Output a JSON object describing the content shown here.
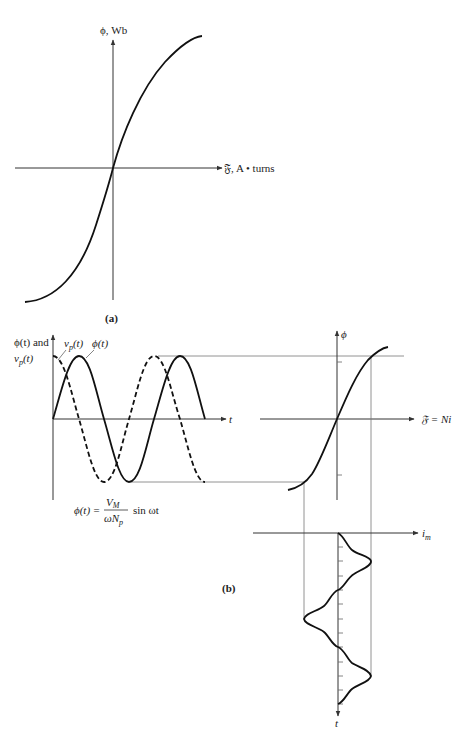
{
  "figure_a": {
    "y_axis_label": "ϕ, Wb",
    "x_axis_label": "𝔉, A • turns",
    "caption": "(a)",
    "curve": "magnetization curve (saturating S-curve through origin)"
  },
  "figure_b": {
    "caption": "(b)",
    "time_plot": {
      "y_axis_label_line1": "ϕ(t) and",
      "y_axis_label_line2": "v",
      "y_axis_label_line2_sub": "p",
      "y_axis_label_line2_rest": "(t)",
      "x_axis_label": "t",
      "series": [
        {
          "name": "vp(t)",
          "label_main": "v",
          "label_sub": "p",
          "label_rest": "(t)",
          "style": "dashed",
          "shape": "cosine"
        },
        {
          "name": "ϕ(t)",
          "label": "ϕ(t)",
          "style": "solid",
          "shape": "sine"
        }
      ],
      "equation": {
        "lhs": "ϕ(t) =",
        "numerator": "V",
        "numerator_sub": "M",
        "denominator": "ωN",
        "denominator_sub": "p",
        "rhs": "sin ωt"
      }
    },
    "magnetization_plot": {
      "y_axis_label": "ϕ",
      "x_axis_label": "𝔉 = Ni"
    },
    "current_plot": {
      "x_axis_label": "i",
      "x_axis_label_sub": "m",
      "y_axis_label": "t",
      "tick_count": 12
    }
  }
}
